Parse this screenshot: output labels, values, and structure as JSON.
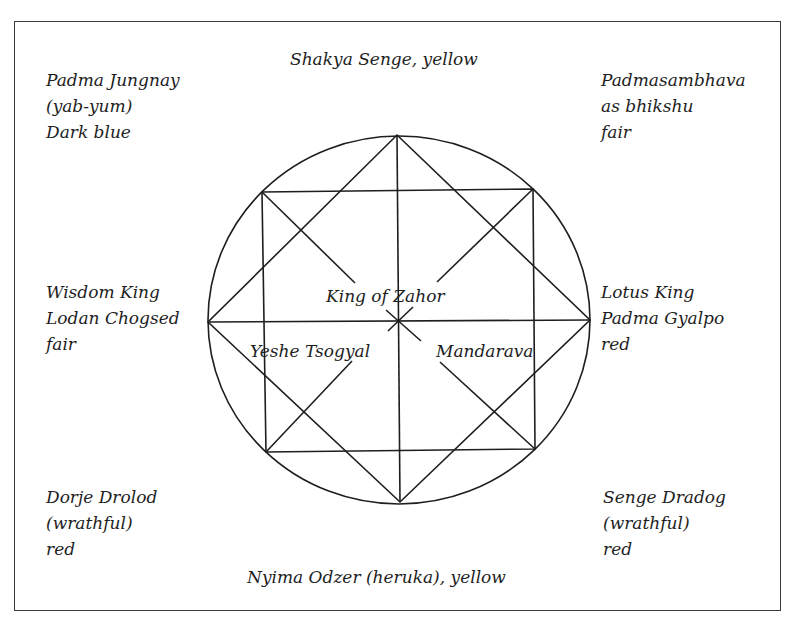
{
  "diagram": {
    "type": "mandala",
    "colors": {
      "line": "#1e1e1e",
      "text": "#1e1e1e",
      "background": "#ffffff"
    },
    "top_label": "Shakya Senge, yellow",
    "bottom_label": "Nyima Odzer (heruka), yellow",
    "top_left": {
      "lines": [
        "Padma Jungnay",
        "(yab-yum)",
        "Dark blue"
      ]
    },
    "top_right": {
      "lines": [
        "Padmasambhava",
        "as bhikshu",
        "fair"
      ]
    },
    "left": {
      "lines": [
        "Wisdom King",
        "Lodan Chogsed",
        "fair"
      ]
    },
    "right": {
      "lines": [
        "Lotus King",
        "Padma Gyalpo",
        "red"
      ]
    },
    "bottom_left": {
      "lines": [
        "Dorje Drolod",
        "(wrathful)",
        "red"
      ]
    },
    "bottom_right": {
      "lines": [
        "Senge Dradog",
        "(wrathful)",
        "red"
      ]
    },
    "center": {
      "top": "King of Zahor",
      "left": "Yeshe Tsogyal",
      "right": "Mandarava"
    },
    "geometry": {
      "circle": {
        "cx": 399,
        "cy": 320,
        "rx": 191,
        "ry": 184
      },
      "diamond": [
        [
          397,
          135
        ],
        [
          590,
          320
        ],
        [
          400,
          502
        ],
        [
          208,
          322
        ]
      ],
      "square": [
        [
          262,
          192
        ],
        [
          533,
          189
        ],
        [
          535,
          449
        ],
        [
          266,
          452
        ]
      ],
      "center": [
        399,
        321
      ]
    }
  }
}
